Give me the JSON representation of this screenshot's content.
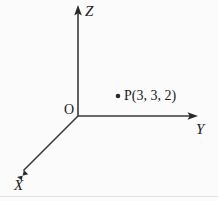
{
  "figure": {
    "type": "3d-coordinate-axes-diagram",
    "background_color": "#fbfbfb",
    "stroke_color": "#3a3a3a",
    "text_color": "#1a1a1a",
    "width": 218,
    "height": 201
  },
  "axes": {
    "z": {
      "label": "Z",
      "origin": [
        78,
        116
      ],
      "tip": [
        78,
        7
      ],
      "direction": "up",
      "arrowhead": true
    },
    "y": {
      "label": "Y",
      "origin": [
        78,
        116
      ],
      "tip": [
        196,
        116
      ],
      "direction": "right",
      "arrowhead": true
    },
    "x": {
      "label": "X",
      "origin": [
        78,
        116
      ],
      "tip": [
        18,
        176
      ],
      "direction": "down-left",
      "arrowhead": true
    }
  },
  "origin": {
    "label": "O",
    "position": [
      78,
      116
    ]
  },
  "points": [
    {
      "label": "P(3, 3, 2)",
      "name": "P",
      "coordinates": [
        3,
        3,
        2
      ],
      "marker_position": [
        118,
        96
      ],
      "marker": "filled-dot"
    }
  ]
}
